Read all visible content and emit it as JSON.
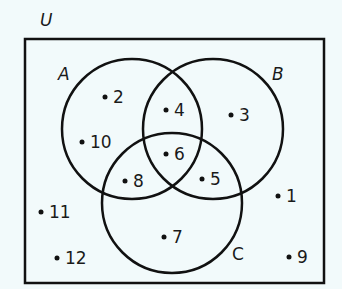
{
  "diagram": {
    "type": "venn",
    "universal_set": {
      "label": "U"
    },
    "sets": [
      {
        "id": "A",
        "label": "A"
      },
      {
        "id": "B",
        "label": "B"
      },
      {
        "id": "C",
        "label": "C"
      }
    ],
    "elements": [
      {
        "value": "2",
        "region": "A only"
      },
      {
        "value": "10",
        "region": "A only"
      },
      {
        "value": "4",
        "region": "A and B only"
      },
      {
        "value": "3",
        "region": "B only"
      },
      {
        "value": "6",
        "region": "A and B and C"
      },
      {
        "value": "8",
        "region": "A and C only"
      },
      {
        "value": "5",
        "region": "B and C only"
      },
      {
        "value": "7",
        "region": "C only"
      },
      {
        "value": "1",
        "region": "outside all sets"
      },
      {
        "value": "11",
        "region": "outside all sets"
      },
      {
        "value": "12",
        "region": "outside all sets"
      },
      {
        "value": "9",
        "region": "outside all sets"
      }
    ],
    "colors": {
      "background": "#f2fafb",
      "stroke": "#111111"
    }
  }
}
